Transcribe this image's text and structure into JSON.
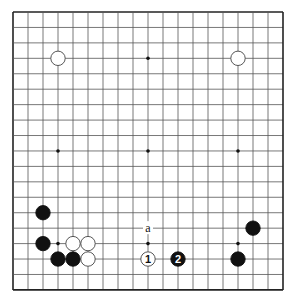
{
  "board": {
    "size": 19,
    "origin_x": 13,
    "origin_y": 12,
    "step_x": 15,
    "step_y": 15.44,
    "line_color": "#555555",
    "border_color": "#222222",
    "star_points": [
      [
        3,
        3
      ],
      [
        9,
        3
      ],
      [
        15,
        3
      ],
      [
        3,
        9
      ],
      [
        9,
        9
      ],
      [
        15,
        9
      ],
      [
        3,
        15
      ],
      [
        9,
        15
      ],
      [
        15,
        15
      ]
    ]
  },
  "stones": [
    {
      "color": "white",
      "col": 3,
      "row": 3,
      "label": ""
    },
    {
      "color": "white",
      "col": 15,
      "row": 3,
      "label": ""
    },
    {
      "color": "black",
      "col": 2,
      "row": 13,
      "label": ""
    },
    {
      "color": "black",
      "col": 2,
      "row": 15,
      "label": ""
    },
    {
      "color": "white",
      "col": 4,
      "row": 15,
      "label": ""
    },
    {
      "color": "white",
      "col": 5,
      "row": 15,
      "label": ""
    },
    {
      "color": "black",
      "col": 3,
      "row": 16,
      "label": ""
    },
    {
      "color": "black",
      "col": 4,
      "row": 16,
      "label": ""
    },
    {
      "color": "white",
      "col": 5,
      "row": 16,
      "label": ""
    },
    {
      "color": "white",
      "col": 9,
      "row": 16,
      "label": "1"
    },
    {
      "color": "black",
      "col": 11,
      "row": 16,
      "label": "2"
    },
    {
      "color": "black",
      "col": 16,
      "row": 14,
      "label": ""
    },
    {
      "color": "black",
      "col": 15,
      "row": 16,
      "label": ""
    }
  ],
  "markers": [
    {
      "col": 9,
      "row": 14,
      "label": "a"
    }
  ]
}
